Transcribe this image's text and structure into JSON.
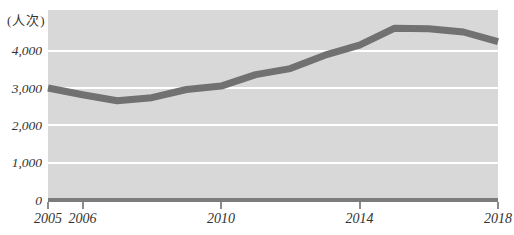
{
  "colors": {
    "page_bg": "#ffffff",
    "plot_bg": "#d8d8d8",
    "gridline": "#ffffff",
    "line": "#717171",
    "axis_line": "#7c7c7c",
    "tick": "#8c8c8c",
    "text": "#333333"
  },
  "chart_data": {
    "type": "line",
    "title": "",
    "unit_label": "(人次)",
    "xlabel": "",
    "ylabel": "人次",
    "legend": "none",
    "grid": "horizontal",
    "xlim": [
      2005,
      2018
    ],
    "ylim": [
      0,
      5000
    ],
    "x": [
      2005,
      2006,
      2007,
      2008,
      2009,
      2010,
      2011,
      2012,
      2013,
      2014,
      2015,
      2016,
      2017,
      2018
    ],
    "values": [
      3000,
      2820,
      2660,
      2740,
      2960,
      3050,
      3360,
      3520,
      3880,
      4150,
      4600,
      4590,
      4500,
      4240
    ],
    "y_ticks": [
      0,
      1000,
      2000,
      3000,
      4000
    ],
    "y_tick_labels": [
      "0",
      "1,000",
      "2,000",
      "3,000",
      "4,000"
    ],
    "x_tick_years": [
      2005,
      2006,
      2010,
      2014,
      2018
    ],
    "x_tick_labels": [
      "2005",
      "2006",
      "2010",
      "2014",
      "2018"
    ]
  }
}
